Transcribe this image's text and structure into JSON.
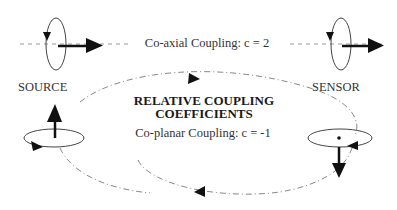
{
  "diagram": {
    "title_line1": "RELATIVE  COUPLING",
    "title_line2": "COEFFICIENTS",
    "coaxial_label": "Co-axial Coupling:  c = 2",
    "coplanar_label": "Co-planar Coupling:  c = -1",
    "source_label": "SOURCE",
    "sensor_label": "SENSOR",
    "colors": {
      "background": "#ffffff",
      "ink": "#111111",
      "text": "#333333",
      "dashed_line": "#888888"
    },
    "elements": [
      {
        "id": "source-coil-vertical",
        "type": "coil",
        "orientation": "vertical",
        "arrow": "right"
      },
      {
        "id": "sensor-coil-vertical",
        "type": "coil",
        "orientation": "vertical",
        "arrow": "right"
      },
      {
        "id": "source-coil-horizontal",
        "type": "coil",
        "orientation": "horizontal",
        "arrow": "up"
      },
      {
        "id": "sensor-coil-horizontal",
        "type": "coil",
        "orientation": "horizontal",
        "arrow": "down"
      },
      {
        "id": "coaxial-axis",
        "type": "dashed-line"
      },
      {
        "id": "coplanar-loop",
        "type": "dash-dot-ellipse",
        "direction": "clockwise"
      }
    ]
  }
}
